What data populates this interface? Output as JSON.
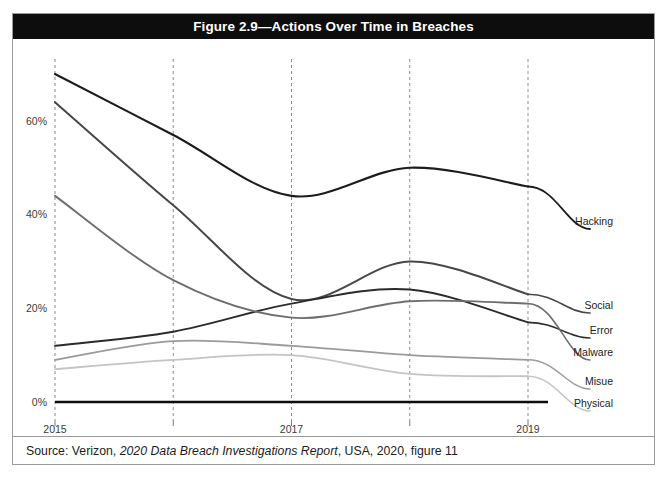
{
  "figure": {
    "title": "Figure 2.9—Actions Over Time in Breaches",
    "source_prefix": "Source: Verizon, ",
    "source_italic": "2020 Data Breach Investigations Report",
    "source_suffix": ", USA, 2020, figure 11"
  },
  "chart_data": {
    "type": "line",
    "title": "Figure 2.9—Actions Over Time in Breaches",
    "subtitle": "",
    "xlabel": "",
    "ylabel": "",
    "x": [
      2015,
      2016,
      2017,
      2018,
      2019
    ],
    "xtick_labels": [
      "2015",
      "",
      "2017",
      "",
      "2019"
    ],
    "xtick_values": [
      2015,
      2016,
      2017,
      2018,
      2019
    ],
    "ytick_labels": [
      "0%",
      "20%",
      "40%",
      "60%"
    ],
    "ytick_values": [
      0,
      20,
      40,
      60
    ],
    "xlim": [
      2015,
      2019
    ],
    "ylim": [
      0,
      70
    ],
    "grid": "vertical-dashed",
    "legend_position": "right-inline-labels",
    "series": [
      {
        "name": "Hacking",
        "values": [
          70,
          57,
          44,
          50,
          46
        ],
        "color": "#1c1c1c",
        "width": 2.1
      },
      {
        "name": "Social",
        "values": [
          64,
          42,
          22,
          30,
          23
        ],
        "color": "#474747",
        "width": 2.0
      },
      {
        "name": "Error",
        "values": [
          12,
          15,
          21,
          24,
          17
        ],
        "color": "#2b2b2b",
        "width": 1.9
      },
      {
        "name": "Malware",
        "values": [
          44,
          26,
          18,
          21.5,
          21
        ],
        "color": "#6e6e6e",
        "width": 1.9
      },
      {
        "name": "Misue",
        "values": [
          9,
          13,
          12,
          10,
          9
        ],
        "color": "#9a9a9a",
        "width": 1.8
      },
      {
        "name": "Physical",
        "values": [
          7,
          9,
          10,
          6,
          5.5
        ],
        "color": "#c4c4c4",
        "width": 1.8
      }
    ],
    "baseline": {
      "name": "axis-baseline",
      "value": 0,
      "color": "#0d0d0d",
      "width": 2.6
    }
  },
  "colors": {
    "title_bar": "#0d0d0d",
    "title_text": "#ffffff",
    "card_border": "#9a9a9a",
    "gridline": "#8a8a8a",
    "axis_text": "#3a3a3a",
    "background": "#ffffff"
  },
  "axis": {
    "y_ticks": [
      "0%",
      "20%",
      "40%",
      "60%"
    ],
    "x_ticks": [
      "2015",
      "2017",
      "2019"
    ]
  }
}
